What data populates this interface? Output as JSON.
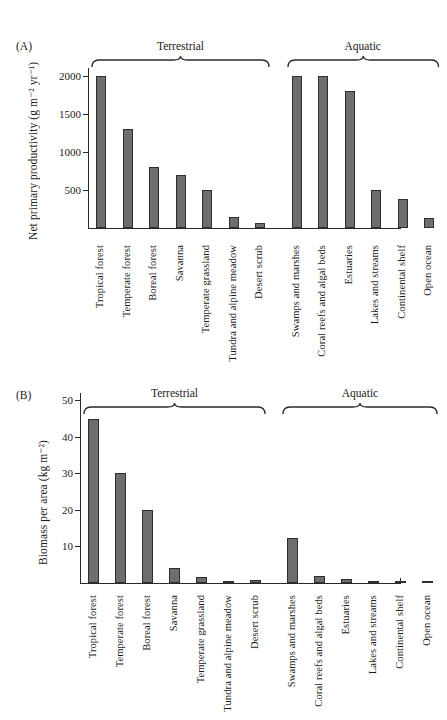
{
  "figure": {
    "panel_a_label": "(A)",
    "panel_b_label": "(B)",
    "group_terrestrial": "Terrestrial",
    "group_aquatic": "Aquatic"
  },
  "chart_data": [
    {
      "type": "bar",
      "panel": "(A)",
      "title": "",
      "ylabel": "Net primary productivity (g m⁻² yr⁻¹)",
      "xlabel": "",
      "ylim": [
        0,
        2100
      ],
      "yticks": [
        500,
        1000,
        1500,
        2000
      ],
      "ytick_labels": [
        "500",
        "1000",
        "1500",
        "2000"
      ],
      "grid": false,
      "groups": [
        {
          "name": "Terrestrial",
          "start": 0,
          "end": 6
        },
        {
          "name": "Aquatic",
          "start": 7,
          "end": 12
        }
      ],
      "categories": [
        "Tropical forest",
        "Temperate forest",
        "Boreal forest",
        "Savanna",
        "Temperate grassland",
        "Tundra and alpine meadow",
        "Desert scrub",
        "Swamps and marshes",
        "Coral reefs and algal beds",
        "Estuaries",
        "Lakes and streams",
        "Continental shelf",
        "Open ocean"
      ],
      "values": [
        2000,
        1300,
        800,
        700,
        500,
        140,
        70,
        2000,
        2000,
        1800,
        500,
        380,
        130
      ]
    },
    {
      "type": "bar",
      "panel": "(B)",
      "title": "",
      "ylabel": "Biomass per area (kg m⁻²)",
      "xlabel": "",
      "ylim": [
        0,
        52
      ],
      "yticks": [
        10,
        20,
        30,
        40,
        50
      ],
      "ytick_labels": [
        "10",
        "20",
        "30",
        "40",
        "50"
      ],
      "grid": false,
      "groups": [
        {
          "name": "Terrestrial",
          "start": 0,
          "end": 6
        },
        {
          "name": "Aquatic",
          "start": 7,
          "end": 12
        }
      ],
      "categories": [
        "Tropical forest",
        "Temperate forest",
        "Boreal forest",
        "Savanna",
        "Temperate grassland",
        "Tundra and alpine meadow",
        "Desert scrub",
        "Swamps and marshes",
        "Coral reefs and algal beds",
        "Estuaries",
        "Lakes and streams",
        "Continental shelf",
        "Open ocean"
      ],
      "values": [
        45,
        30,
        20,
        4,
        1.6,
        0.6,
        0.7,
        12.3,
        2,
        1,
        0.2,
        0.2,
        0.1
      ]
    }
  ],
  "colors": {
    "bar_fill": "#6e6e6e",
    "bar_stroke": "#2e2e2e",
    "axis": "#2a2a2a",
    "text": "#1a1a1a",
    "background": "#ffffff"
  }
}
